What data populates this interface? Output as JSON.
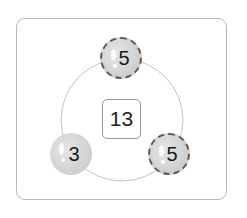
{
  "diagram": {
    "type": "number-bond-circle",
    "center": {
      "value": "13"
    },
    "balls": [
      {
        "position": "top",
        "value": "5",
        "crossed_out": true
      },
      {
        "position": "bottom-left",
        "value": "3",
        "crossed_out": false
      },
      {
        "position": "bottom-right",
        "value": "5",
        "crossed_out": true
      }
    ]
  }
}
